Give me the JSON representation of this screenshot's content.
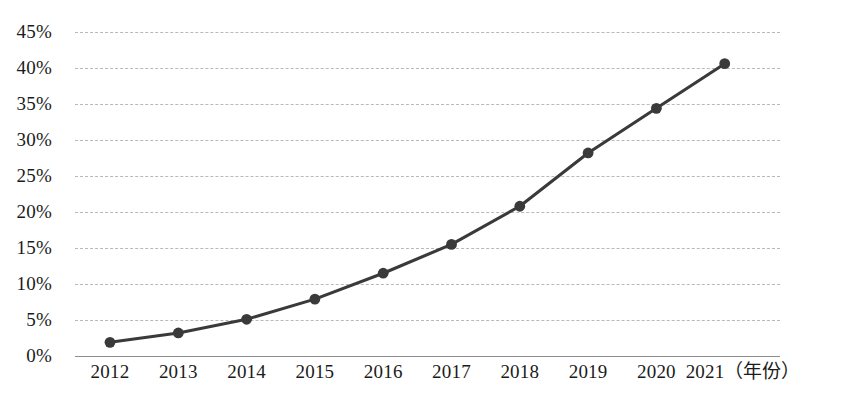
{
  "chart_data": {
    "type": "line",
    "title": "",
    "subtitle": "",
    "xlabel": "年份",
    "ylabel": "",
    "categories": [
      "2012",
      "2013",
      "2014",
      "2015",
      "2016",
      "2017",
      "2018",
      "2019",
      "2020",
      "2021"
    ],
    "x": [
      2012,
      2013,
      2014,
      2015,
      2016,
      2017,
      2018,
      2019,
      2020,
      2021
    ],
    "series": [
      {
        "name": "",
        "values": [
          1.9,
          3.2,
          5.1,
          7.9,
          11.5,
          15.5,
          20.8,
          28.2,
          34.4,
          40.6
        ],
        "unit": "%",
        "line_color": "#3a3a3a",
        "marker_color": "#3a3a3a",
        "marker": "circle"
      }
    ],
    "ylim": [
      0,
      45
    ],
    "ytick_values": [
      0,
      5,
      10,
      15,
      20,
      25,
      30,
      35,
      40,
      45
    ],
    "ytick_labels": [
      "0%",
      "5%",
      "10%",
      "15%",
      "20%",
      "25%",
      "30%",
      "35%",
      "40%",
      "45%"
    ],
    "xtick_labels": [
      "2012",
      "2013",
      "2014",
      "2015",
      "2016",
      "2017",
      "2018",
      "2019",
      "2020",
      "2021"
    ],
    "x_axis_unit_label": "（年份）",
    "grid": true,
    "grid_axis": "y",
    "grid_style": "dashed",
    "grid_color": "#b9b9bd",
    "axis_color": "#8d8d90",
    "legend": false,
    "legend_position": "none",
    "background": "#ffffff"
  },
  "axis": {
    "x_last_label_with_unit": "2021（年份）"
  }
}
